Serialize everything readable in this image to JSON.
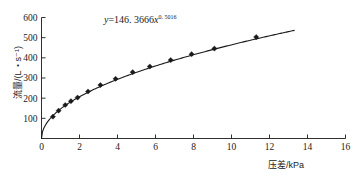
{
  "chart_data": {
    "type": "scatter",
    "title": "",
    "subtitle": "",
    "xlabel": "压差/kPa",
    "ylabel": "流量/(L・s⁻¹)",
    "xlim": [
      0,
      16
    ],
    "ylim": [
      0,
      600
    ],
    "xticks": [
      0,
      2,
      4,
      6,
      8,
      10,
      12,
      14,
      16
    ],
    "xtick_labels": [
      "0",
      "2",
      "4",
      "6",
      "8",
      "10",
      "12",
      "14",
      "16"
    ],
    "yticks": [
      100,
      200,
      300,
      400,
      500,
      600
    ],
    "ytick_labels": [
      "100",
      "200",
      "300",
      "400",
      "500",
      "600"
    ],
    "grid": false,
    "legend": false,
    "marker_style": "diamond",
    "line_color": "#1a1a1a",
    "marker_color": "#1a1a1a",
    "background_color": "#ffffff",
    "annotation": {
      "text": "y=146.3666x^0.5016",
      "lhs": "y",
      "equals": "=",
      "coefficient": "146. 3666",
      "variable": "x",
      "exponent": "0. 5016",
      "x_position": 4.2,
      "y_position": 560
    },
    "fit": {
      "model": "power",
      "coefficient": 146.3666,
      "exponent": 0.5016,
      "x_start": 0.0,
      "x_end": 13.3
    },
    "x": [
      0.6,
      0.9,
      1.25,
      1.55,
      1.9,
      2.45,
      3.1,
      3.9,
      4.8,
      5.7,
      6.8,
      7.9,
      9.1,
      11.3
    ],
    "y": [
      108,
      138,
      166,
      185,
      203,
      233,
      265,
      296,
      329,
      357,
      389,
      418,
      446,
      503
    ],
    "points": [
      {
        "x": 0.6,
        "y": 108
      },
      {
        "x": 0.9,
        "y": 138
      },
      {
        "x": 1.25,
        "y": 166
      },
      {
        "x": 1.55,
        "y": 185
      },
      {
        "x": 1.9,
        "y": 203
      },
      {
        "x": 2.45,
        "y": 233
      },
      {
        "x": 3.1,
        "y": 265
      },
      {
        "x": 3.9,
        "y": 296
      },
      {
        "x": 4.8,
        "y": 329
      },
      {
        "x": 5.7,
        "y": 357
      },
      {
        "x": 6.8,
        "y": 389
      },
      {
        "x": 7.9,
        "y": 418
      },
      {
        "x": 9.1,
        "y": 446
      },
      {
        "x": 11.3,
        "y": 503
      }
    ]
  }
}
